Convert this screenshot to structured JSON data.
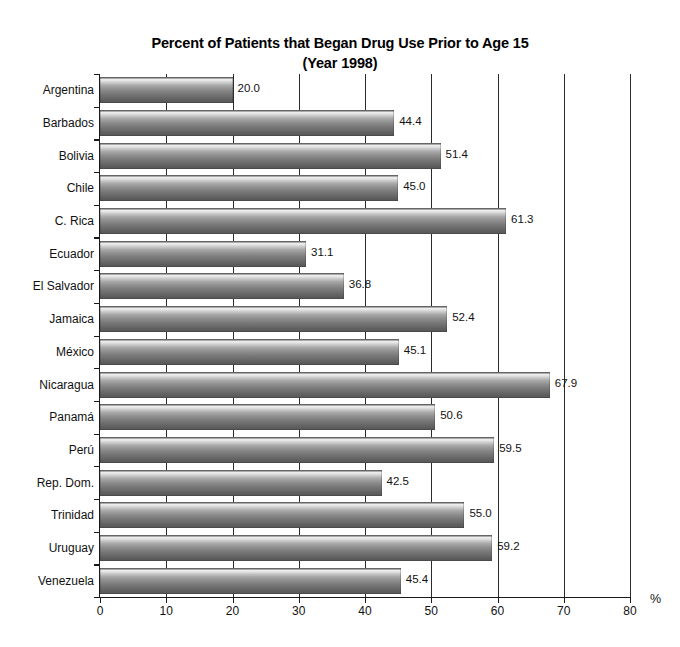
{
  "chart_data": {
    "type": "bar",
    "orientation": "horizontal",
    "title": "Percent of Patients that Began Drug Use Prior to Age 15",
    "subtitle": "(Year 1998)",
    "xlabel": "%",
    "ylabel": "",
    "xlim": [
      0,
      80
    ],
    "xticks": [
      0,
      10,
      20,
      30,
      40,
      50,
      60,
      70,
      80
    ],
    "grid": "vertical",
    "legend": "none",
    "categories": [
      "Argentina",
      "Barbados",
      "Bolivia",
      "Chile",
      "C. Rica",
      "Ecuador",
      "El Salvador",
      "Jamaica",
      "México",
      "Nicaragua",
      "Panamá",
      "Perú",
      "Rep. Dom.",
      "Trinidad",
      "Uruguay",
      "Venezuela"
    ],
    "values": [
      20.0,
      44.4,
      51.4,
      45.0,
      61.3,
      31.1,
      36.8,
      52.4,
      45.1,
      67.9,
      50.6,
      59.5,
      42.5,
      55.0,
      59.2,
      45.4
    ],
    "value_labels": [
      "20.0",
      "44.4",
      "51.4",
      "45.0",
      "61.3",
      "31.1",
      "36.8",
      "52.4",
      "45.1",
      "67.9",
      "50.6",
      "59.5",
      "42.5",
      "55.0",
      "59.2",
      "45.4"
    ],
    "bar_color": "#8e8e8e",
    "axis_color": "#1a1a1a",
    "grid_color": "#2b2b2b",
    "background": "#ffffff"
  },
  "axis": {
    "x_unit_label": "%",
    "x_tick_labels": [
      "0",
      "10",
      "20",
      "30",
      "40",
      "50",
      "60",
      "70",
      "80"
    ]
  },
  "artifact": {
    "top_cut_text": ""
  }
}
